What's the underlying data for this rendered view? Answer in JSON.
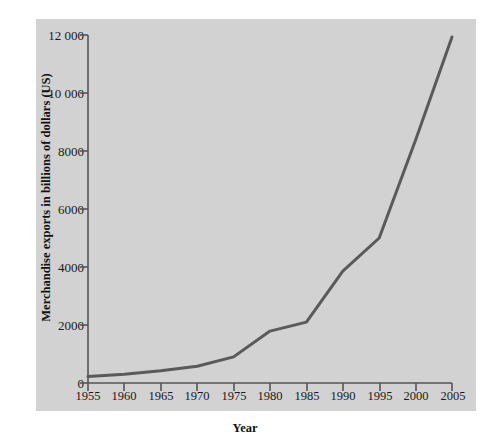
{
  "chart_data": {
    "type": "line",
    "title": "",
    "xlabel": "Year",
    "ylabel": "Merchandise exports in billions of dollars (US)",
    "x": [
      1955,
      1960,
      1965,
      1970,
      1975,
      1980,
      1985,
      1990,
      1995,
      2000,
      2005
    ],
    "values": [
      220,
      300,
      420,
      580,
      900,
      1790,
      2100,
      3860,
      5000,
      8380,
      11930
    ],
    "series": [
      {
        "name": "Merchandise exports",
        "values": [
          220,
          300,
          420,
          580,
          900,
          1790,
          2100,
          3860,
          5000,
          8380,
          11930
        ]
      }
    ],
    "xlim": [
      1955,
      2005
    ],
    "ylim": [
      0,
      12000
    ],
    "xticks": [
      1955,
      1960,
      1965,
      1970,
      1975,
      1980,
      1985,
      1990,
      1995,
      2000,
      2005
    ],
    "xtick_labels": [
      "1955",
      "1960",
      "1965",
      "1970",
      "1975",
      "1980",
      "1985",
      "1990",
      "1995",
      "2000",
      "2005"
    ],
    "yticks": [
      0,
      2000,
      4000,
      6000,
      8000,
      10000,
      12000
    ],
    "ytick_labels": [
      "0",
      "2000",
      "4000",
      "6000",
      "8000",
      "10 000",
      "12 000"
    ],
    "grid": false,
    "legend": "none",
    "line_color": "#5a5a5a",
    "line_width": 3,
    "panel_color": "#d2d2d2",
    "axis_color": "#555555",
    "background_color": "#ffffff"
  }
}
